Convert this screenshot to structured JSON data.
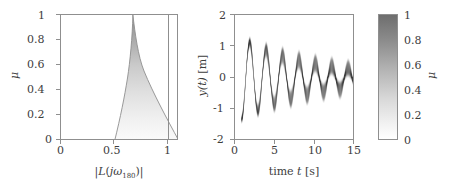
{
  "figure": {
    "background_color": "#ffffff",
    "axis_color": "#8f8f8f",
    "text_color": "#3d3d3d"
  },
  "chart_data": [
    {
      "type": "area",
      "panel": "left",
      "title": "",
      "xlabel": "|L(jω_180)|",
      "xlabel_display": "|L(jω180)|",
      "ylabel": "μ",
      "xlim": [
        0,
        1.1
      ],
      "ylim": [
        0,
        1
      ],
      "xticks": [
        0,
        0.5,
        1
      ],
      "xtick_labels": [
        "0",
        "0.5",
        "1"
      ],
      "yticks": [
        0,
        0.2,
        0.4,
        0.6,
        0.8,
        1
      ],
      "ytick_labels": [
        "0",
        "0.2",
        "0.4",
        "0.6",
        "0.8",
        "1"
      ],
      "grid": false,
      "legend": "none",
      "shaded_region": {
        "name": "describing-function-uncertainty-wedge",
        "apex": [
          0.67,
          1.0
        ],
        "left_boundary": [
          [
            0.5,
            0.0
          ],
          [
            0.52,
            0.1
          ],
          [
            0.545,
            0.2
          ],
          [
            0.572,
            0.3
          ],
          [
            0.598,
            0.4
          ],
          [
            0.62,
            0.5
          ],
          [
            0.638,
            0.6
          ],
          [
            0.652,
            0.7
          ],
          [
            0.662,
            0.8
          ],
          [
            0.667,
            0.9
          ],
          [
            0.67,
            1.0
          ]
        ],
        "right_boundary": [
          [
            0.67,
            1.0
          ],
          [
            0.69,
            0.9
          ],
          [
            0.715,
            0.8
          ],
          [
            0.745,
            0.7
          ],
          [
            0.782,
            0.6
          ],
          [
            0.827,
            0.5
          ],
          [
            0.878,
            0.4
          ],
          [
            0.935,
            0.3
          ],
          [
            0.995,
            0.2
          ],
          [
            1.052,
            0.1
          ],
          [
            1.1,
            0.0
          ]
        ],
        "fill_gradient": "grayscale, dark at mu=1, white at mu=0"
      },
      "reference_lines": [
        {
          "name": "unity-gain-line",
          "orientation": "vertical",
          "x": 1.0
        }
      ]
    },
    {
      "type": "heatmap",
      "panel": "right",
      "title": "",
      "xlabel": "time t [s]",
      "ylabel": "y(t) [m]",
      "xlim": [
        0,
        15
      ],
      "ylim": [
        -2,
        2
      ],
      "xticks": [
        0,
        5,
        10,
        15
      ],
      "xtick_labels": [
        "0",
        "5",
        "10",
        "15"
      ],
      "yticks": [
        -2,
        -1,
        0,
        1,
        2
      ],
      "ytick_labels": [
        "-2",
        "-1",
        "0",
        "1",
        "2"
      ],
      "grid": false,
      "legend": "colorbar-right",
      "colormap": "grayscale-inverted",
      "description": "ensemble of decaying oscillatory responses shaded by mu",
      "oscillation": {
        "period_s": 2.05,
        "start_time_s": 0.75,
        "peak_times_s": [
          1.75,
          3.8,
          5.85,
          7.9,
          9.95,
          12.0,
          14.05
        ],
        "trough_times_s": [
          2.8,
          4.85,
          6.9,
          8.95,
          11.0,
          13.05
        ],
        "peak_amplitudes_m": [
          0.95,
          0.88,
          0.7,
          0.55,
          0.44,
          0.36,
          0.3
        ],
        "trough_amplitudes_m": [
          -1.15,
          -0.92,
          -0.72,
          -0.55,
          -0.44,
          -0.36
        ],
        "steady_state_m": 0.0
      }
    }
  ],
  "colorbar": {
    "name": "mu-colorbar",
    "label": "μ",
    "ticks": [
      1,
      0.8,
      0.6,
      0.4,
      0.2,
      0
    ],
    "tick_labels": [
      "1",
      "0.8",
      "0.6",
      "0.4",
      "0.2",
      "0"
    ],
    "min": 0,
    "max": 1,
    "low_color": "#ffffff",
    "high_color": "#6e6e6e"
  },
  "left_panel": {
    "xlabel": "|L(jω180)|",
    "xlabel_parts": {
      "bar_open": "|",
      "l": "L",
      "paren_open": "(",
      "j": "j",
      "omega": "ω",
      "subscript": "180",
      "paren_close": ")",
      "bar_close": "|"
    },
    "ylabel": "μ",
    "xtick_labels": [
      "0",
      "0.5",
      "1"
    ],
    "ytick_labels": [
      "0",
      "0.2",
      "0.4",
      "0.6",
      "0.8",
      "1"
    ]
  },
  "right_panel": {
    "xlabel_parts": {
      "time": "time",
      "t": "t",
      "unit": "[s]"
    },
    "xlabel": "time t [s]",
    "ylabel": "y(t) [m]",
    "ylabel_parts": {
      "y": "y",
      "paren": "(t)",
      "unit": "[m]"
    },
    "xtick_labels": [
      "0",
      "5",
      "10",
      "15"
    ],
    "ytick_labels": [
      "2",
      "1",
      "0",
      "-1",
      "-2"
    ]
  }
}
